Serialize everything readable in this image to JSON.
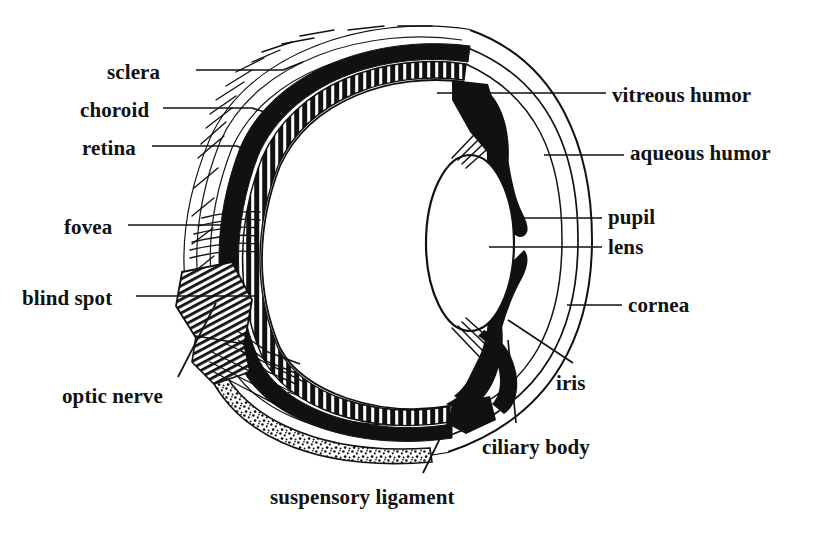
{
  "figure": {
    "style": "black-and-white engraved line drawing",
    "background_color": "#ffffff",
    "ink_color": "#111111"
  },
  "labels": {
    "sclera": "sclera",
    "choroid": "choroid",
    "retina": "retina",
    "fovea": "fovea",
    "blind_spot": "blind spot",
    "optic_nerve": "optic nerve",
    "vitreous_humor": "vitreous humor",
    "aqueous_humor": "aqueous humor",
    "pupil": "pupil",
    "lens": "lens",
    "cornea": "cornea",
    "iris": "iris",
    "ciliary_body": "ciliary body",
    "suspensory_ligament": "suspensory ligament"
  },
  "parts": [
    {
      "id": "sclera",
      "label": "sclera",
      "side": "left",
      "label_x": 107,
      "label_y": 62
    },
    {
      "id": "choroid",
      "label": "choroid",
      "side": "left",
      "label_x": 80,
      "label_y": 100
    },
    {
      "id": "retina",
      "label": "retina",
      "side": "left",
      "label_x": 82,
      "label_y": 138
    },
    {
      "id": "fovea",
      "label": "fovea",
      "side": "left",
      "label_x": 64,
      "label_y": 217
    },
    {
      "id": "blind-spot",
      "label": "blind spot",
      "side": "left",
      "label_x": 22,
      "label_y": 288
    },
    {
      "id": "optic-nerve",
      "label": "optic nerve",
      "side": "left",
      "label_x": 62,
      "label_y": 386
    },
    {
      "id": "vitreous-humor",
      "label": "vitreous humor",
      "side": "right",
      "label_x": 612,
      "label_y": 85
    },
    {
      "id": "aqueous-humor",
      "label": "aqueous humor",
      "side": "right",
      "label_x": 630,
      "label_y": 143
    },
    {
      "id": "pupil",
      "label": "pupil",
      "side": "right",
      "label_x": 608,
      "label_y": 207
    },
    {
      "id": "lens",
      "label": "lens",
      "side": "right",
      "label_x": 608,
      "label_y": 237
    },
    {
      "id": "cornea",
      "label": "cornea",
      "side": "right",
      "label_x": 628,
      "label_y": 295
    },
    {
      "id": "iris",
      "label": "iris",
      "side": "right",
      "label_x": 556,
      "label_y": 373
    },
    {
      "id": "ciliary-body",
      "label": "ciliary body",
      "side": "bottom",
      "label_x": 482,
      "label_y": 437
    },
    {
      "id": "suspensory-ligament",
      "label": "suspensory ligament",
      "side": "bottom",
      "label_x": 270,
      "label_y": 487
    }
  ],
  "leader_lines": [
    {
      "id": "sclera",
      "points": "196,70 283,70 303,62"
    },
    {
      "id": "choroid",
      "points": "163,108 252,108 268,113"
    },
    {
      "id": "retina",
      "points": "152,146 237,146 246,150"
    },
    {
      "id": "fovea",
      "points": "128,225 238,225"
    },
    {
      "id": "blind-spot",
      "points": "136,296 258,296"
    },
    {
      "id": "optic-nerve",
      "points": "178,377 216,303"
    },
    {
      "id": "vitreous-humor",
      "points": "437,93 606,93"
    },
    {
      "id": "aqueous-humor",
      "points": "544,155 624,155"
    },
    {
      "id": "pupil",
      "points": "514,218 602,218"
    },
    {
      "id": "lens",
      "points": "489,247 602,247"
    },
    {
      "id": "cornea",
      "points": "567,305 622,305"
    },
    {
      "id": "iris",
      "points": "508,320 573,363"
    },
    {
      "id": "ciliary-body",
      "points": "508,340 516,423"
    },
    {
      "id": "suspensory-ligament",
      "points": "423,473 487,343"
    }
  ]
}
